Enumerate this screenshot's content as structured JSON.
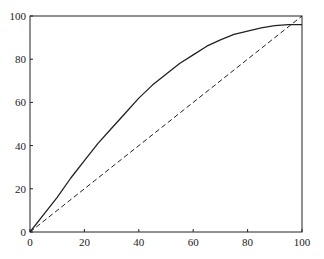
{
  "chart_data": {
    "type": "line",
    "title": "",
    "xlabel": "",
    "ylabel": "",
    "xlim": [
      0,
      100
    ],
    "ylim": [
      0,
      100
    ],
    "x_ticks": [
      0,
      20,
      40,
      60,
      80,
      100
    ],
    "y_ticks": [
      0,
      20,
      40,
      60,
      80,
      100
    ],
    "grid": false,
    "legend": null,
    "series": [
      {
        "name": "curve",
        "style": "solid",
        "color": "#222222",
        "x": [
          0,
          5,
          10,
          15,
          20,
          25,
          30,
          35,
          40,
          45,
          50,
          55,
          60,
          65,
          70,
          75,
          80,
          85,
          90,
          95,
          100
        ],
        "y": [
          0,
          8,
          16,
          25,
          33,
          41,
          48,
          55,
          62,
          68,
          73,
          78,
          82,
          86,
          89,
          91.5,
          93,
          94.5,
          95.5,
          96,
          96
        ]
      },
      {
        "name": "diagonal",
        "style": "dashed",
        "color": "#222222",
        "x": [
          0,
          100
        ],
        "y": [
          0,
          100
        ]
      }
    ]
  },
  "plot": {
    "left": 30,
    "right": 302,
    "top": 16,
    "bottom": 232
  }
}
